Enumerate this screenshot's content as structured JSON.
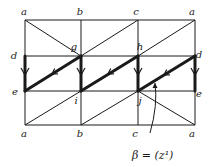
{
  "diagram": {
    "type": "triangulated-grid",
    "colors": {
      "ink": "#1a1a1a",
      "background": "#ffffff"
    },
    "columns_x": [
      25,
      81,
      138,
      195
    ],
    "rows_y": [
      20,
      56,
      91,
      125
    ],
    "vertex_labels": {
      "top": [
        "a",
        "b",
        "c",
        "a"
      ],
      "upper_middle": [
        "d",
        "g",
        "h",
        "d"
      ],
      "lower_middle": [
        "e",
        "i",
        "j",
        "e"
      ],
      "bottom": [
        "a",
        "b",
        "c",
        "a"
      ]
    },
    "labels": [
      {
        "id": "top-a-left",
        "text": "a",
        "x": 24,
        "y": 15
      },
      {
        "id": "top-b",
        "text": "b",
        "x": 80,
        "y": 15
      },
      {
        "id": "top-c",
        "text": "c",
        "x": 136,
        "y": 15
      },
      {
        "id": "top-a-right",
        "text": "a",
        "x": 192,
        "y": 15
      },
      {
        "id": "mid-d-left",
        "text": "d",
        "x": 14,
        "y": 59
      },
      {
        "id": "mid-g",
        "text": "g",
        "x": 74,
        "y": 50
      },
      {
        "id": "mid-h",
        "text": "h",
        "x": 140,
        "y": 50
      },
      {
        "id": "mid-d-right",
        "text": "d",
        "x": 199,
        "y": 58
      },
      {
        "id": "low-e-left",
        "text": "e",
        "x": 15,
        "y": 95
      },
      {
        "id": "low-i",
        "text": "i",
        "x": 76,
        "y": 104
      },
      {
        "id": "low-j",
        "text": "j",
        "x": 140,
        "y": 104
      },
      {
        "id": "low-e-right",
        "text": "e",
        "x": 199,
        "y": 97
      },
      {
        "id": "bot-a-left",
        "text": "a",
        "x": 24,
        "y": 137
      },
      {
        "id": "bot-b",
        "text": "b",
        "x": 80,
        "y": 137
      },
      {
        "id": "bot-c",
        "text": "c",
        "x": 135,
        "y": 137
      },
      {
        "id": "bot-a-right",
        "text": "a",
        "x": 192,
        "y": 137
      }
    ],
    "annotation": {
      "text": "β = (z¹)",
      "x": 132,
      "y": 159
    },
    "thin_lines": [
      [
        25,
        20,
        195,
        20
      ],
      [
        25,
        56,
        195,
        56
      ],
      [
        25,
        91,
        195,
        91
      ],
      [
        25,
        125,
        195,
        125
      ],
      [
        25,
        20,
        25,
        125
      ],
      [
        81,
        20,
        81,
        125
      ],
      [
        138,
        20,
        138,
        125
      ],
      [
        195,
        20,
        195,
        125
      ],
      [
        25,
        20,
        81,
        56
      ],
      [
        81,
        56,
        138,
        20
      ],
      [
        138,
        56,
        195,
        20
      ],
      [
        25,
        125,
        81,
        91
      ],
      [
        81,
        125,
        138,
        91
      ],
      [
        138,
        91,
        195,
        125
      ]
    ],
    "thick_lines": [
      [
        25,
        56,
        25,
        91
      ],
      [
        81,
        56,
        81,
        91
      ],
      [
        138,
        56,
        138,
        91
      ],
      [
        195,
        56,
        195,
        91
      ],
      [
        81,
        56,
        25,
        91
      ],
      [
        138,
        56,
        81,
        91
      ],
      [
        195,
        56,
        138,
        91
      ]
    ],
    "arrows_down": [
      {
        "x": 25,
        "y": 72
      },
      {
        "x": 81,
        "y": 72
      },
      {
        "x": 138,
        "y": 72
      },
      {
        "x": 195,
        "y": 72
      }
    ],
    "arrows_diag": [
      {
        "x": 52,
        "y": 74
      },
      {
        "x": 108,
        "y": 74
      },
      {
        "x": 164,
        "y": 75
      }
    ],
    "pointer": {
      "from": [
        150,
        133
      ],
      "ctrl": [
        158,
        105
      ],
      "to": [
        155,
        83
      ]
    }
  }
}
